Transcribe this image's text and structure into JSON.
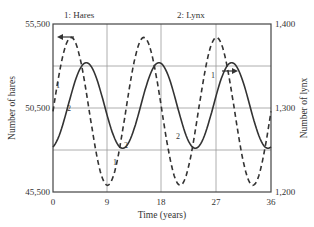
{
  "chart_data": {
    "type": "line",
    "title": "",
    "series_labels": {
      "left": "1: Hares",
      "right": "2: Lynx"
    },
    "xlabel": "Time (years)",
    "ylabel_left": "Number of hares",
    "ylabel_right": "Number of lynx",
    "x_ticks": [
      "0",
      "9",
      "18",
      "27",
      "36"
    ],
    "xlim": [
      0,
      36
    ],
    "ylim_left": [
      45500,
      55500
    ],
    "ylim_right": [
      1200,
      1400
    ],
    "y_ticks_left": [
      "45,500",
      "50,500",
      "55,500"
    ],
    "y_ticks_right": [
      "1,200",
      "1,300",
      "1,400"
    ],
    "grid": true,
    "series": [
      {
        "name": "Hares",
        "marker": "1",
        "style": "dashed",
        "axis": "left",
        "period": 12,
        "mean": 50300,
        "amplitude": 4400,
        "peak_time": 3,
        "x": [
          0,
          3,
          6,
          9,
          12,
          15,
          18,
          21,
          24,
          27,
          30,
          33,
          36
        ],
        "values": [
          50300,
          54700,
          50300,
          45900,
          50300,
          54700,
          50300,
          45900,
          50300,
          54700,
          50300,
          45900,
          50300
        ]
      },
      {
        "name": "Lynx",
        "marker": "2",
        "style": "solid",
        "axis": "right",
        "period": 12,
        "mean": 1303,
        "amplitude": 51,
        "peak_time": 5.5,
        "x": [
          0,
          2.5,
          5.5,
          8.5,
          11.5,
          14.5,
          17.5,
          20.5,
          23.5,
          26.5,
          29.5,
          32.5,
          35.5
        ],
        "values": [
          1258,
          1303,
          1354,
          1303,
          1252,
          1303,
          1354,
          1303,
          1252,
          1303,
          1354,
          1303,
          1252
        ]
      }
    ],
    "annotations": [
      {
        "text": "arrow pointing left on hares curve (left axis)",
        "x": 2,
        "y": 54700
      },
      {
        "text": "arrow pointing right on lynx curve (right axis)",
        "x": 31,
        "y": 1340
      }
    ]
  }
}
